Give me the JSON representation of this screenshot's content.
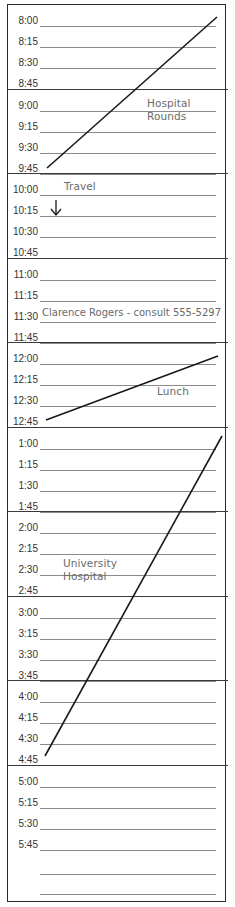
{
  "planner": {
    "hours": [
      {
        "slots": [
          "8:00",
          "8:15",
          "8:30",
          "8:45"
        ]
      },
      {
        "slots": [
          "9:00",
          "9:15",
          "9:30",
          "9:45"
        ]
      },
      {
        "slots": [
          "10:00",
          "10:15",
          "10:30",
          "10:45"
        ]
      },
      {
        "slots": [
          "11:00",
          "11:15",
          "11:30",
          "11:45"
        ]
      },
      {
        "slots": [
          "12:00",
          "12:15",
          "12:30",
          "12:45"
        ]
      },
      {
        "slots": [
          "1:00",
          "1:15",
          "1:30",
          "1:45"
        ]
      },
      {
        "slots": [
          "2:00",
          "2:15",
          "2:30",
          "2:45"
        ]
      },
      {
        "slots": [
          "3:00",
          "3:15",
          "3:30",
          "3:45"
        ]
      },
      {
        "slots": [
          "4:00",
          "4:15",
          "4:30",
          "4:45"
        ]
      },
      {
        "slots": [
          "5:00",
          "5:15",
          "5:30",
          "5:45"
        ]
      }
    ],
    "extra_blank_lines": 2
  },
  "entries": {
    "hospital_rounds": {
      "line1": "Hospital",
      "line2": "Rounds",
      "span": "8:00 - 9:45"
    },
    "travel": {
      "label": "Travel",
      "span": "10:00 - 10:15"
    },
    "consult": {
      "text": "Clarence Rogers - consult 555-5297",
      "time": "11:30"
    },
    "lunch": {
      "label": "Lunch",
      "span": "12:00 - 12:45"
    },
    "university_hospital": {
      "line1": "University",
      "line2": "Hospital",
      "span": "1:00 - 4:45"
    }
  },
  "colors": {
    "ink": "#1a1a1a",
    "handwriting": "#6a6a6a",
    "rule": "#8a8a8a",
    "border": "#2a2a2a"
  }
}
